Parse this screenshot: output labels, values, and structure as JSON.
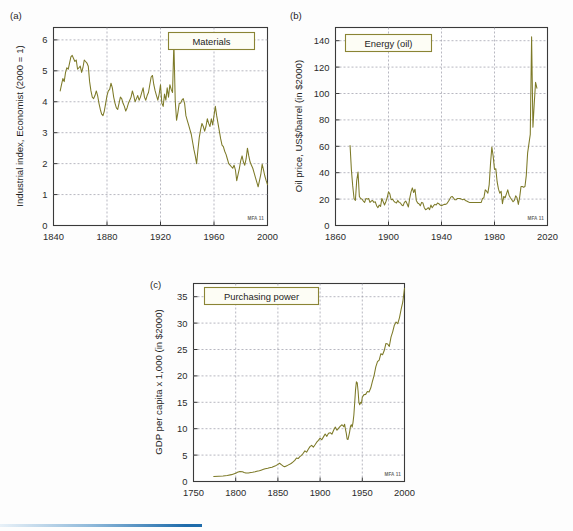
{
  "figure": {
    "panels": [
      "a",
      "b",
      "c"
    ],
    "line_color": "#7d7a28",
    "legend_border_color": "#8a8434",
    "grid_color": "#9a9aa6",
    "credit": "MFA 11"
  },
  "panel_a": {
    "letter": "(a)",
    "legend": "Materials",
    "credit": "MFA 11",
    "chart_data": {
      "type": "line",
      "title": "Materials",
      "xlabel": "",
      "ylabel": "Industrial index, Economist (2000 = 1)",
      "xlim": [
        1840,
        2000
      ],
      "ylim": [
        0,
        6.4
      ],
      "xticks": [
        1840,
        1880,
        1920,
        1960,
        2000
      ],
      "yticks": [
        0,
        1,
        2,
        3,
        4,
        5,
        6
      ],
      "grid": true,
      "legend_position": "top-right",
      "x": [
        1845,
        1846,
        1847,
        1848,
        1849,
        1850,
        1851,
        1852,
        1853,
        1854,
        1855,
        1856,
        1857,
        1858,
        1859,
        1860,
        1861,
        1862,
        1863,
        1864,
        1865,
        1866,
        1867,
        1868,
        1869,
        1870,
        1871,
        1872,
        1873,
        1874,
        1875,
        1876,
        1877,
        1878,
        1879,
        1880,
        1881,
        1882,
        1883,
        1884,
        1885,
        1886,
        1887,
        1888,
        1889,
        1890,
        1891,
        1892,
        1893,
        1894,
        1895,
        1896,
        1897,
        1898,
        1899,
        1900,
        1901,
        1902,
        1903,
        1904,
        1905,
        1906,
        1907,
        1908,
        1909,
        1910,
        1911,
        1912,
        1913,
        1914,
        1915,
        1916,
        1917,
        1918,
        1919,
        1920,
        1921,
        1922,
        1923,
        1924,
        1925,
        1926,
        1927,
        1928,
        1929,
        1930,
        1931,
        1932,
        1933,
        1934,
        1935,
        1936,
        1937,
        1938,
        1939,
        1940,
        1941,
        1942,
        1943,
        1944,
        1945,
        1946,
        1947,
        1948,
        1949,
        1950,
        1951,
        1952,
        1953,
        1954,
        1955,
        1956,
        1957,
        1958,
        1959,
        1960,
        1961,
        1962,
        1963,
        1964,
        1965,
        1966,
        1967,
        1968,
        1969,
        1970,
        1971,
        1972,
        1973,
        1974,
        1975,
        1976,
        1977,
        1978,
        1979,
        1980,
        1981,
        1982,
        1983,
        1984,
        1985,
        1986,
        1987,
        1988,
        1989,
        1990,
        1991,
        1992,
        1993,
        1994,
        1995,
        1996,
        1997,
        1998,
        1999,
        2000
      ],
      "y": [
        4.35,
        4.55,
        4.75,
        4.65,
        4.95,
        5.1,
        5.05,
        5.25,
        5.45,
        5.5,
        5.4,
        5.3,
        5.35,
        5.05,
        5.1,
        5.15,
        4.95,
        5.1,
        5.35,
        5.3,
        5.25,
        5.15,
        4.65,
        4.35,
        4.15,
        4.1,
        4.2,
        4.35,
        4.2,
        3.95,
        3.75,
        3.6,
        3.55,
        3.7,
        3.95,
        4.2,
        4.35,
        4.4,
        4.6,
        4.45,
        4.15,
        3.95,
        3.8,
        3.75,
        3.95,
        4.15,
        4.1,
        3.95,
        3.85,
        3.7,
        3.8,
        3.95,
        4.05,
        4.15,
        4.35,
        4.2,
        4.0,
        4.1,
        4.2,
        4.05,
        4.15,
        4.3,
        4.45,
        4.15,
        4.05,
        4.2,
        4.3,
        4.55,
        4.8,
        4.85,
        4.55,
        4.35,
        4.2,
        4.05,
        4.25,
        4.55,
        3.95,
        3.85,
        4.25,
        4.05,
        4.45,
        4.15,
        4.55,
        4.4,
        4.3,
        5.9,
        4.05,
        3.4,
        3.65,
        3.95,
        3.95,
        4.05,
        4.1,
        3.95,
        3.55,
        3.4,
        3.25,
        3.1,
        2.95,
        2.7,
        2.45,
        2.25,
        2.0,
        2.45,
        2.85,
        3.1,
        3.3,
        3.2,
        3.05,
        3.2,
        3.45,
        3.3,
        3.2,
        3.45,
        3.25,
        3.55,
        3.85,
        3.55,
        3.3,
        3.05,
        2.8,
        2.6,
        2.55,
        2.4,
        2.3,
        2.15,
        2.0,
        1.95,
        1.9,
        1.85,
        1.95,
        1.8,
        1.45,
        1.65,
        1.85,
        2.1,
        2.25,
        2.05,
        1.95,
        2.15,
        2.5,
        2.25,
        2.05,
        1.95,
        1.85,
        1.7,
        1.55,
        1.4,
        1.25,
        1.45,
        1.65,
        1.98,
        1.8,
        1.6,
        1.45,
        1.32,
        1.48,
        1.35,
        1.2,
        1.08,
        1.0
      ]
    }
  },
  "panel_b": {
    "letter": "(b)",
    "legend": "Energy (oil)",
    "credit": "MFA 11",
    "chart_data": {
      "type": "line",
      "title": "Energy (oil)",
      "xlabel": "",
      "ylabel": "Oil price, US$/barrel (in $2000)",
      "xlim": [
        1860,
        2020
      ],
      "ylim": [
        0,
        150
      ],
      "xticks": [
        1860,
        1900,
        1940,
        1980,
        2020
      ],
      "yticks": [
        0,
        20,
        40,
        60,
        80,
        100,
        120,
        140
      ],
      "grid": true,
      "legend_position": "top-left",
      "x": [
        1871,
        1872,
        1873,
        1874,
        1875,
        1876,
        1877,
        1878,
        1879,
        1880,
        1881,
        1882,
        1883,
        1884,
        1885,
        1886,
        1887,
        1888,
        1889,
        1890,
        1891,
        1892,
        1893,
        1894,
        1895,
        1896,
        1897,
        1898,
        1899,
        1900,
        1901,
        1902,
        1903,
        1904,
        1905,
        1906,
        1907,
        1908,
        1909,
        1910,
        1911,
        1912,
        1913,
        1914,
        1915,
        1916,
        1917,
        1918,
        1919,
        1920,
        1921,
        1922,
        1923,
        1924,
        1925,
        1926,
        1927,
        1928,
        1929,
        1930,
        1931,
        1932,
        1933,
        1934,
        1935,
        1936,
        1937,
        1938,
        1939,
        1940,
        1941,
        1942,
        1943,
        1944,
        1945,
        1946,
        1947,
        1948,
        1949,
        1950,
        1951,
        1952,
        1953,
        1954,
        1955,
        1956,
        1957,
        1958,
        1959,
        1960,
        1961,
        1962,
        1963,
        1964,
        1965,
        1966,
        1967,
        1968,
        1969,
        1970,
        1971,
        1972,
        1973,
        1974,
        1975,
        1976,
        1977,
        1978,
        1979,
        1980,
        1981,
        1982,
        1983,
        1984,
        1985,
        1986,
        1987,
        1988,
        1989,
        1990,
        1991,
        1992,
        1993,
        1994,
        1995,
        1996,
        1997,
        1998,
        1999,
        2000,
        2001,
        2002,
        2003,
        2004,
        2005,
        2006,
        2007,
        2008,
        2009,
        2010,
        2011,
        2012
      ],
      "y": [
        60.5,
        42.0,
        30.0,
        20.5,
        19.0,
        34.0,
        40.5,
        22.0,
        20.5,
        20.0,
        18.5,
        17.5,
        20.5,
        20.0,
        20.5,
        17.5,
        18.5,
        19.0,
        17.5,
        18.0,
        15.0,
        13.5,
        15.5,
        14.5,
        20.5,
        18.0,
        15.5,
        18.0,
        21.0,
        25.5,
        24.0,
        19.5,
        20.0,
        18.5,
        17.5,
        17.0,
        19.0,
        17.5,
        17.0,
        15.5,
        15.0,
        17.5,
        18.5,
        16.5,
        14.0,
        20.5,
        25.5,
        28.5,
        25.0,
        27.5,
        19.0,
        17.0,
        16.5,
        15.0,
        17.5,
        17.0,
        13.5,
        12.0,
        12.5,
        13.5,
        12.0,
        15.5,
        13.5,
        15.0,
        16.0,
        15.5,
        17.0,
        16.5,
        15.5,
        15.0,
        15.5,
        16.0,
        16.0,
        16.5,
        18.0,
        19.5,
        21.5,
        22.0,
        21.0,
        19.5,
        19.5,
        20.5,
        20.5,
        20.5,
        20.0,
        19.5,
        20.0,
        19.0,
        18.5,
        18.0,
        17.5,
        17.5,
        17.5,
        17.5,
        17.5,
        17.5,
        17.5,
        17.5,
        17.5,
        17.5,
        20.5,
        21.0,
        27.0,
        26.0,
        24.5,
        31.0,
        47.0,
        59.5,
        52.5,
        42.5,
        43.0,
        33.0,
        27.5,
        24.5,
        26.0,
        16.5,
        22.0,
        21.0,
        24.0,
        27.0,
        23.0,
        21.0,
        19.5,
        18.0,
        19.0,
        22.5,
        21.0,
        16.0,
        21.5,
        29.5,
        29.5,
        29.0,
        29.5,
        38.0,
        55.0,
        62.0,
        69.0,
        143.0,
        74.5,
        92.5,
        108.5,
        104.0
      ]
    }
  },
  "panel_c": {
    "letter": "(c)",
    "legend": "Purchasing power",
    "credit": "MFA 11",
    "chart_data": {
      "type": "line",
      "title": "Purchasing power",
      "xlabel": "",
      "ylabel": "GDP per capita x 1,000 (in $2000)",
      "xlim": [
        1750,
        2000
      ],
      "ylim": [
        0,
        37.5
      ],
      "xticks": [
        1750,
        1800,
        1850,
        1900,
        1950,
        2000
      ],
      "yticks": [
        0,
        5,
        10,
        15,
        20,
        25,
        30,
        35
      ],
      "grid": true,
      "legend_position": "top-left",
      "x": [
        1774,
        1780,
        1785,
        1790,
        1795,
        1800,
        1802,
        1805,
        1808,
        1810,
        1812,
        1815,
        1818,
        1820,
        1823,
        1825,
        1828,
        1830,
        1833,
        1835,
        1838,
        1840,
        1843,
        1845,
        1848,
        1850,
        1852,
        1854,
        1856,
        1858,
        1860,
        1862,
        1864,
        1866,
        1868,
        1870,
        1872,
        1874,
        1876,
        1878,
        1880,
        1882,
        1884,
        1886,
        1888,
        1890,
        1892,
        1894,
        1896,
        1898,
        1900,
        1902,
        1904,
        1906,
        1908,
        1910,
        1912,
        1914,
        1916,
        1918,
        1920,
        1922,
        1924,
        1926,
        1928,
        1929,
        1930,
        1931,
        1932,
        1933,
        1934,
        1935,
        1936,
        1937,
        1938,
        1939,
        1940,
        1941,
        1942,
        1943,
        1944,
        1945,
        1946,
        1947,
        1948,
        1949,
        1950,
        1952,
        1954,
        1956,
        1958,
        1960,
        1962,
        1964,
        1966,
        1968,
        1970,
        1972,
        1974,
        1976,
        1978,
        1980,
        1982,
        1984,
        1986,
        1988,
        1990,
        1992,
        1994,
        1996,
        1998,
        2000
      ],
      "y": [
        0.95,
        1.0,
        1.05,
        1.15,
        1.3,
        1.55,
        1.75,
        1.9,
        1.85,
        1.7,
        1.6,
        1.62,
        1.7,
        1.75,
        1.85,
        1.95,
        2.05,
        2.15,
        2.3,
        2.4,
        2.5,
        2.6,
        2.7,
        2.85,
        3.05,
        3.25,
        3.45,
        3.2,
        2.95,
        2.8,
        2.95,
        3.1,
        3.25,
        3.45,
        3.7,
        4.0,
        4.45,
        4.35,
        4.7,
        4.95,
        5.35,
        5.8,
        5.55,
        6.1,
        6.6,
        6.85,
        6.5,
        6.95,
        7.45,
        7.8,
        8.2,
        7.9,
        8.45,
        9.0,
        8.55,
        9.15,
        9.25,
        8.95,
        9.7,
        10.3,
        9.7,
        10.1,
        10.5,
        10.75,
        10.4,
        10.85,
        9.9,
        9.15,
        8.05,
        7.95,
        8.65,
        9.4,
        10.45,
        10.75,
        10.3,
        11.2,
        12.6,
        14.9,
        17.4,
        18.9,
        18.7,
        17.15,
        14.95,
        14.55,
        15.0,
        14.85,
        15.95,
        16.45,
        16.5,
        17.05,
        16.95,
        17.7,
        18.95,
        20.1,
        21.7,
        22.7,
        23.0,
        24.2,
        24.0,
        24.8,
        26.15,
        26.05,
        25.6,
        27.35,
        28.35,
        29.6,
        30.2,
        29.9,
        31.0,
        32.6,
        34.0,
        36.6
      ]
    }
  }
}
